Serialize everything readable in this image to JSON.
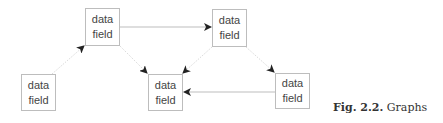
{
  "diagram": {
    "nodes": [
      {
        "id": "n1",
        "line1": "data",
        "line2": "field",
        "x": 85,
        "y": 8,
        "w": 35,
        "h": 38
      },
      {
        "id": "n2",
        "line1": "data",
        "line2": "field",
        "x": 212,
        "y": 9,
        "w": 35,
        "h": 38
      },
      {
        "id": "n3",
        "line1": "data",
        "line2": "field",
        "x": 21,
        "y": 74,
        "w": 35,
        "h": 37
      },
      {
        "id": "n4",
        "line1": "data",
        "line2": "field",
        "x": 148,
        "y": 74,
        "w": 35,
        "h": 37
      },
      {
        "id": "n5",
        "line1": "data",
        "line2": "field",
        "x": 275,
        "y": 73,
        "w": 35,
        "h": 36
      }
    ],
    "edges": [
      {
        "from": "n3",
        "to": "n1",
        "style": "dotted"
      },
      {
        "from": "n1",
        "to": "n2",
        "style": "solid"
      },
      {
        "from": "n1",
        "to": "n4",
        "style": "dotted"
      },
      {
        "from": "n2",
        "to": "n4",
        "style": "dotted"
      },
      {
        "from": "n2",
        "to": "n5",
        "style": "dotted"
      },
      {
        "from": "n5",
        "to": "n4",
        "style": "solid"
      }
    ]
  },
  "caption": {
    "label": "Fig. 2.2.",
    "text": "Graphs"
  }
}
